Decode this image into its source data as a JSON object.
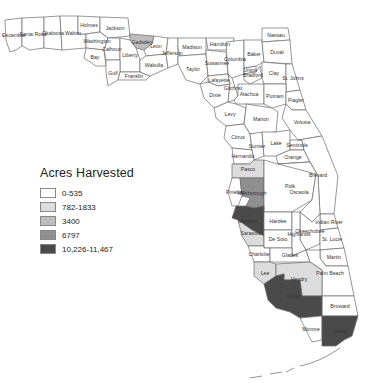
{
  "title": "Acres Harvested",
  "legend": {
    "title": "Acres Harvested",
    "items": [
      {
        "label": "0-535",
        "color": "#ffffff"
      },
      {
        "label": "782-1833",
        "color": "#dcdcdc"
      },
      {
        "label": "3400",
        "color": "#bdbdbd"
      },
      {
        "label": "6797",
        "color": "#8f8f8f"
      },
      {
        "label": "10,226-11,467",
        "color": "#4a4a4a"
      }
    ]
  },
  "counties": {
    "escambia": {
      "label": "Escambia",
      "cls": 0
    },
    "santa_rosa": {
      "label": "Santa Rosa",
      "cls": 0
    },
    "okaloosa": {
      "label": "Okaloosa",
      "cls": 0
    },
    "walton": {
      "label": "Walton",
      "cls": 0
    },
    "holmes": {
      "label": "Holmes",
      "cls": 0
    },
    "jackson": {
      "label": "Jackson",
      "cls": 0
    },
    "washington": {
      "label": "Washington",
      "cls": 0
    },
    "bay": {
      "label": "Bay",
      "cls": 0
    },
    "calhoun": {
      "label": "Calhoun",
      "cls": 0
    },
    "gadsden": {
      "label": "Gadsden",
      "cls": 2
    },
    "liberty": {
      "label": "Liberty",
      "cls": 0
    },
    "gulf": {
      "label": "Gulf",
      "cls": 0
    },
    "franklin": {
      "label": "Franklin",
      "cls": 0
    },
    "leon": {
      "label": "Leon",
      "cls": 0
    },
    "wakulla": {
      "label": "Wakulla",
      "cls": 0
    },
    "jefferson": {
      "label": "Jefferson",
      "cls": 0
    },
    "madison": {
      "label": "Madison",
      "cls": 0
    },
    "taylor": {
      "label": "Taylor",
      "cls": 0
    },
    "hamilton": {
      "label": "Hamilton",
      "cls": 0
    },
    "suwannee": {
      "label": "Suwannee",
      "cls": 0
    },
    "columbia": {
      "label": "Columbia",
      "cls": 0
    },
    "lafayette": {
      "label": "Lafayette",
      "cls": 0
    },
    "dixie": {
      "label": "Dixie",
      "cls": 0
    },
    "gilchrist": {
      "label": "Gilchrist",
      "cls": 0
    },
    "union": {
      "label": "Union",
      "cls": 0
    },
    "bradford": {
      "label": "Bradford",
      "cls": 0
    },
    "baker": {
      "label": "Baker",
      "cls": 0
    },
    "nassau": {
      "label": "Nassau",
      "cls": 0
    },
    "duval": {
      "label": "Duval",
      "cls": 0
    },
    "clay": {
      "label": "Clay",
      "cls": 0
    },
    "st_johns": {
      "label": "St. Johns",
      "cls": 0
    },
    "alachua": {
      "label": "Alachua",
      "cls": 0
    },
    "putnam": {
      "label": "Putnam",
      "cls": 0
    },
    "flagler": {
      "label": "Flagler",
      "cls": 0
    },
    "levy": {
      "label": "Levy",
      "cls": 0
    },
    "marion": {
      "label": "Marion",
      "cls": 0
    },
    "volusia": {
      "label": "Volusia",
      "cls": 0
    },
    "citrus": {
      "label": "Citrus",
      "cls": 0
    },
    "sumter": {
      "label": "Sumter",
      "cls": 0
    },
    "lake": {
      "label": "Lake",
      "cls": 0
    },
    "seminole": {
      "label": "Seminole",
      "cls": 0
    },
    "orange": {
      "label": "Orange",
      "cls": 0
    },
    "brevard": {
      "label": "Brevard",
      "cls": 0
    },
    "hernando": {
      "label": "Hernando",
      "cls": 0
    },
    "pasco": {
      "label": "Pasco",
      "cls": 1
    },
    "hillsborough": {
      "label": "Hillsborough",
      "cls": 3
    },
    "pinellas": {
      "label": "Pinellas",
      "cls": 0
    },
    "polk": {
      "label": "Polk",
      "cls": 0
    },
    "osceola": {
      "label": "Osceola",
      "cls": 0
    },
    "indian_river": {
      "label": "Indian River",
      "cls": 0
    },
    "manatee": {
      "label": "Manatee",
      "cls": 4
    },
    "hardee": {
      "label": "Hardee",
      "cls": 0
    },
    "okeechobee": {
      "label": "Okeechobee",
      "cls": 0
    },
    "st_lucie": {
      "label": "St. Lucie",
      "cls": 0
    },
    "sarasota": {
      "label": "Sarasota",
      "cls": 1
    },
    "de_soto": {
      "label": "De Soto",
      "cls": 0
    },
    "highlands": {
      "label": "Highlands",
      "cls": 0
    },
    "martin": {
      "label": "Martin",
      "cls": 0
    },
    "charlotte": {
      "label": "Charlotte",
      "cls": 0
    },
    "glades": {
      "label": "Glades",
      "cls": 0
    },
    "palm_beach": {
      "label": "Palm Beach",
      "cls": 0
    },
    "lee": {
      "label": "Lee",
      "cls": 1
    },
    "hendry": {
      "label": "Hendry",
      "cls": 1
    },
    "broward": {
      "label": "Broward",
      "cls": 0
    },
    "collier": {
      "label": "Collier",
      "cls": 4
    },
    "monroe": {
      "label": "Monroe",
      "cls": 0
    },
    "dade": {
      "label": "Dade",
      "cls": 4
    }
  }
}
